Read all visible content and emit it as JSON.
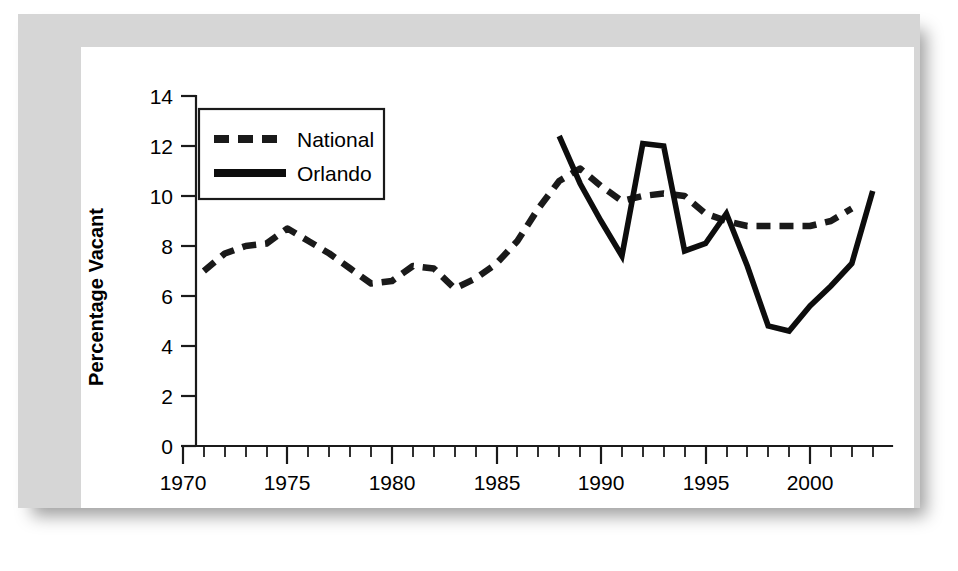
{
  "figure": {
    "background_color": "#ffffff",
    "frame_color": "#d6d6d6",
    "panel_color": "#ffffff"
  },
  "legend": {
    "position": "top-left-inside",
    "entries": [
      {
        "label": "National",
        "style": "dashed",
        "color": "#1a1a1a"
      },
      {
        "label": "Orlando",
        "style": "solid",
        "color": "#0d0d0d"
      }
    ]
  },
  "axes": {
    "ylabel": "Percentage Vacant",
    "xlabel": "",
    "yticks": [
      "0",
      "2",
      "4",
      "6",
      "8",
      "10",
      "12",
      "14"
    ],
    "xticks": [
      "1970",
      "1975",
      "1980",
      "1985",
      "1990",
      "1995",
      "2000"
    ],
    "xlim": [
      1970,
      2003
    ],
    "ylim": [
      0,
      14
    ],
    "x_minor_tick_interval": 1,
    "x_major_tick_interval": 5,
    "grid": "off"
  },
  "chart_data": {
    "type": "line",
    "title": "",
    "xlabel": "",
    "ylabel": "Percentage Vacant",
    "xlim": [
      1970,
      2003
    ],
    "ylim": [
      0,
      14
    ],
    "grid": "off",
    "legend_position": "top-left-inside",
    "x": [
      1971,
      1972,
      1973,
      1974,
      1975,
      1976,
      1977,
      1978,
      1979,
      1980,
      1981,
      1982,
      1983,
      1984,
      1985,
      1986,
      1987,
      1988,
      1989,
      1990,
      1991,
      1992,
      1993,
      1994,
      1995,
      1996,
      1997,
      1998,
      1999,
      2000,
      2001,
      2002
    ],
    "series": [
      {
        "name": "National",
        "style": "dashed",
        "color": "#1a1a1a",
        "x": [
          1971,
          1972,
          1973,
          1974,
          1975,
          1976,
          1977,
          1978,
          1979,
          1980,
          1981,
          1982,
          1983,
          1984,
          1985,
          1986,
          1987,
          1988,
          1989,
          1990,
          1991,
          1992,
          1993,
          1994,
          1995,
          1996,
          1997,
          1998,
          1999,
          2000,
          2001,
          2002
        ],
        "values": [
          7.0,
          7.7,
          8.0,
          8.1,
          8.7,
          8.2,
          7.7,
          7.1,
          6.5,
          6.6,
          7.2,
          7.1,
          6.3,
          6.7,
          7.3,
          8.2,
          9.5,
          10.6,
          11.1,
          10.4,
          9.8,
          10.0,
          10.1,
          10.0,
          9.3,
          9.0,
          8.8,
          8.8,
          8.8,
          8.8,
          9.0,
          9.5
        ]
      },
      {
        "name": "Orlando",
        "style": "solid",
        "color": "#0d0d0d",
        "x": [
          1988,
          1989,
          1990,
          1991,
          1992,
          1993,
          1994,
          1995,
          1996,
          1997,
          1998,
          1999,
          2000,
          2001,
          2002
        ],
        "values": [
          12.4,
          10.5,
          9.0,
          7.6,
          12.1,
          12.0,
          7.8,
          8.1,
          9.3,
          7.2,
          4.8,
          4.6,
          5.6,
          6.4,
          7.3
        ]
      }
    ],
    "series_orlando_tail_note": "",
    "orlando_final_value": 10.2
  }
}
